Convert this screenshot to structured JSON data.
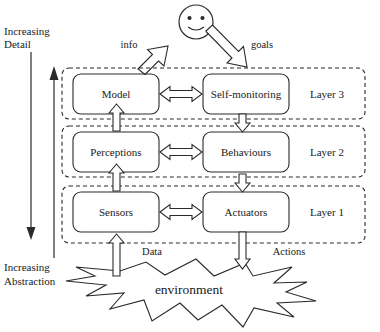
{
  "diagram": {
    "title_hidden": "",
    "axis": {
      "detail_line1": "Increasing",
      "detail_line2": "Detail",
      "abstraction_line1": "Increasing",
      "abstraction_line2": "Abstraction"
    },
    "agent": {
      "icon": "smiley-face-icon",
      "info_label": "info",
      "goals_label": "goals"
    },
    "layers": [
      {
        "id": "layer-3",
        "label": "Layer 3",
        "left_box": "Model",
        "right_box": "Self-monitoring"
      },
      {
        "id": "layer-2",
        "label": "Layer 2",
        "left_box": "Perceptions",
        "right_box": "Behaviours"
      },
      {
        "id": "layer-1",
        "label": "Layer 1",
        "left_box": "Sensors",
        "right_box": "Actuators"
      }
    ],
    "environment": {
      "label": "environment",
      "data_label": "Data",
      "actions_label": "Actions"
    },
    "colors": {
      "stroke": "#2a2a2a",
      "text": "#1a1a1a",
      "background": "#ffffff",
      "arrow_fill": "#ffffff"
    }
  }
}
